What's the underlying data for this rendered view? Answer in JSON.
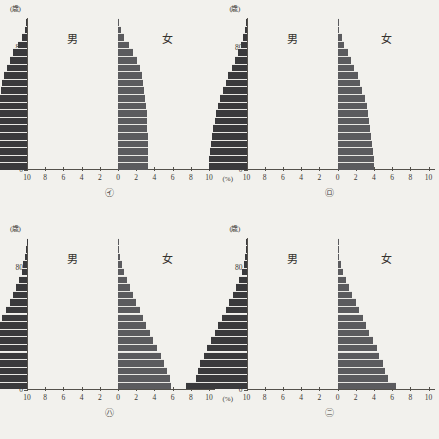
{
  "figure": {
    "layout": "2x2-grid",
    "background_color": "#f2f1ed",
    "male_color": "#3a3a3c",
    "female_color": "#5b5b5e",
    "footer_note": ""
  },
  "axes": {
    "y_unit": "(歳)",
    "x_unit": "(%)",
    "y_ticks": [
      "0",
      "20",
      "40",
      "60",
      "80"
    ],
    "y_values": [
      0,
      20,
      40,
      60,
      80
    ],
    "y_range": [
      0,
      100
    ],
    "x_ticks": [
      "10",
      "8",
      "6",
      "4",
      "2",
      "0",
      "2",
      "4",
      "6",
      "8",
      "10"
    ],
    "x_values": [
      -10,
      -8,
      -6,
      -4,
      -2,
      0,
      2,
      4,
      6,
      8,
      10
    ],
    "x_range": [
      -10,
      10
    ],
    "male_label": "男",
    "female_label": "女"
  },
  "chart_data": [
    {
      "type": "bar",
      "id": "㋑",
      "title": "",
      "xlabel": "(%)",
      "ylabel": "(歳)",
      "xlim": [
        -10,
        10
      ],
      "ylim": [
        0,
        100
      ],
      "grid": false,
      "legend": [
        "男",
        "女"
      ],
      "categories": [
        "0-4",
        "5-9",
        "10-14",
        "15-19",
        "20-24",
        "25-29",
        "30-34",
        "35-39",
        "40-44",
        "45-49",
        "50-54",
        "55-59",
        "60-64",
        "65-69",
        "70-74",
        "75-79",
        "80-84",
        "85-89",
        "90-94",
        "95-99"
      ],
      "series": [
        {
          "name": "男",
          "values": [
            3.4,
            3.4,
            3.4,
            3.4,
            3.4,
            3.3,
            3.3,
            3.3,
            3.1,
            3.0,
            2.9,
            2.7,
            2.5,
            2.2,
            1.9,
            1.5,
            1.0,
            0.6,
            0.25,
            0.08
          ]
        },
        {
          "name": "女",
          "values": [
            3.3,
            3.3,
            3.3,
            3.3,
            3.3,
            3.2,
            3.2,
            3.2,
            3.1,
            3.0,
            2.9,
            2.8,
            2.6,
            2.4,
            2.1,
            1.7,
            1.2,
            0.7,
            0.3,
            0.1
          ]
        }
      ]
    },
    {
      "type": "bar",
      "id": "㋺",
      "title": "",
      "xlabel": "(%)",
      "ylabel": "(歳)",
      "xlim": [
        -10,
        10
      ],
      "ylim": [
        0,
        100
      ],
      "grid": false,
      "legend": [
        "男",
        "女"
      ],
      "categories": [
        "0-4",
        "5-9",
        "10-14",
        "15-19",
        "20-24",
        "25-29",
        "30-34",
        "35-39",
        "40-44",
        "45-49",
        "50-54",
        "55-59",
        "60-64",
        "65-69",
        "70-74",
        "75-79",
        "80-84",
        "85-89",
        "90-94",
        "95-99"
      ],
      "series": [
        {
          "name": "男",
          "values": [
            4.1,
            4.1,
            4.0,
            3.9,
            3.8,
            3.7,
            3.5,
            3.4,
            3.1,
            2.9,
            2.6,
            2.3,
            2.0,
            1.6,
            1.3,
            0.95,
            0.6,
            0.35,
            0.15,
            0.05
          ]
        },
        {
          "name": "女",
          "values": [
            4.0,
            4.0,
            3.9,
            3.8,
            3.7,
            3.6,
            3.5,
            3.4,
            3.2,
            3.0,
            2.7,
            2.5,
            2.2,
            1.8,
            1.5,
            1.1,
            0.75,
            0.45,
            0.2,
            0.07
          ]
        }
      ]
    },
    {
      "type": "bar",
      "id": "㋩",
      "title": "",
      "xlabel": "(%)",
      "ylabel": "(歳)",
      "xlim": [
        -10,
        10
      ],
      "ylim": [
        0,
        100
      ],
      "grid": false,
      "legend": [
        "男",
        "女"
      ],
      "categories": [
        "0-4",
        "5-9",
        "10-14",
        "15-19",
        "20-24",
        "25-29",
        "30-34",
        "35-39",
        "40-44",
        "45-49",
        "50-54",
        "55-59",
        "60-64",
        "65-69",
        "70-74",
        "75-79",
        "80-84",
        "85-89",
        "90-94",
        "95-99"
      ],
      "series": [
        {
          "name": "男",
          "values": [
            5.9,
            5.8,
            5.5,
            5.2,
            4.8,
            4.4,
            4.0,
            3.5,
            3.1,
            2.7,
            2.3,
            1.9,
            1.5,
            1.2,
            0.9,
            0.6,
            0.4,
            0.22,
            0.1,
            0.04
          ]
        },
        {
          "name": "女",
          "values": [
            5.8,
            5.7,
            5.4,
            5.1,
            4.7,
            4.3,
            3.9,
            3.5,
            3.1,
            2.7,
            2.4,
            2.0,
            1.6,
            1.3,
            1.0,
            0.7,
            0.45,
            0.26,
            0.12,
            0.05
          ]
        }
      ]
    },
    {
      "type": "bar",
      "id": "㋥",
      "title": "",
      "xlabel": "(%)",
      "ylabel": "(歳)",
      "xlim": [
        -10,
        10
      ],
      "ylim": [
        0,
        100
      ],
      "grid": false,
      "legend": [
        "男",
        "女"
      ],
      "categories": [
        "0-4",
        "5-9",
        "10-14",
        "15-19",
        "20-24",
        "25-29",
        "30-34",
        "35-39",
        "40-44",
        "45-49",
        "50-54",
        "55-59",
        "60-64",
        "65-69",
        "70-74",
        "75-79",
        "80-84",
        "85-89",
        "90-94",
        "95-99"
      ],
      "series": [
        {
          "name": "男",
          "values": [
            6.6,
            5.6,
            5.3,
            5.1,
            4.7,
            4.3,
            3.9,
            3.5,
            3.1,
            2.7,
            2.3,
            1.9,
            1.5,
            1.2,
            0.85,
            0.55,
            0.33,
            0.18,
            0.08,
            0.03
          ]
        },
        {
          "name": "女",
          "values": [
            6.4,
            5.5,
            5.2,
            5.0,
            4.6,
            4.3,
            3.9,
            3.5,
            3.1,
            2.8,
            2.4,
            2.0,
            1.6,
            1.25,
            0.9,
            0.6,
            0.38,
            0.21,
            0.09,
            0.035
          ]
        }
      ]
    }
  ]
}
